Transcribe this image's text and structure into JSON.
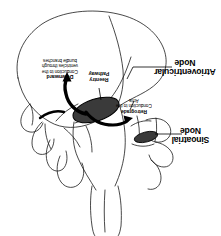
{
  "figure": {
    "orientation": "rotated-180",
    "background_color": "#ffffff",
    "outline_color": "#1a1a1a",
    "node_fill_color": "#3a3a3a",
    "arrow_color": "#000000",
    "text_color": "#000000"
  },
  "labels": {
    "atrioventricular_node": "Atrioventricular Node",
    "sinoatrial_node": "Sinoatrial Node",
    "reentry_pathway": "Reentry Pathway",
    "downward_conduction": {
      "emphasis": "Downward",
      "rest": "Conduction to the ventricles through bundle branches",
      "full": "Downward Conduction to the ventricles through bundle branches"
    },
    "retrograde_conduction": {
      "emphasis": "Retrograde",
      "rest": "Conduction to the Atria",
      "full": "Retrograde Conduction to the Atria"
    }
  },
  "nodes": [
    {
      "name": "atrioventricular-node",
      "shape": "ellipse",
      "cx": 96,
      "cy": 110,
      "rx": 24,
      "ry": 11,
      "rotation": -18
    },
    {
      "name": "sinoatrial-node",
      "shape": "ellipse",
      "cx": 146,
      "cy": 137,
      "rx": 12,
      "ry": 5,
      "rotation": -14
    }
  ]
}
